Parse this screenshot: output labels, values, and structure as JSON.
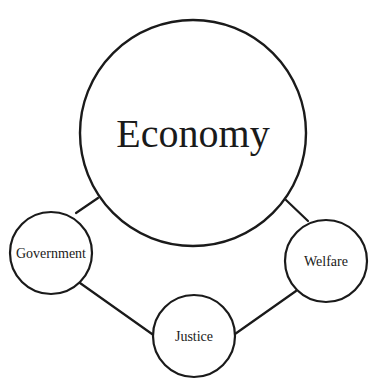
{
  "diagram": {
    "stroke_color": "#1a1a1a",
    "background": "#ffffff",
    "nodes": [
      {
        "id": "economy",
        "label": "Economy",
        "cx": 193,
        "cy": 133,
        "r": 113,
        "font_size": 40
      },
      {
        "id": "government",
        "label": "Government",
        "cx": 51,
        "cy": 253,
        "r": 41,
        "font_size": 14
      },
      {
        "id": "welfare",
        "label": "Welfare",
        "cx": 326,
        "cy": 261,
        "r": 41,
        "font_size": 14
      },
      {
        "id": "justice",
        "label": "Justice",
        "cx": 194,
        "cy": 336,
        "r": 41,
        "font_size": 14
      }
    ],
    "edges": [
      {
        "from": "economy",
        "to": "government",
        "x1": 98,
        "y1": 198,
        "x2": 76,
        "y2": 213
      },
      {
        "from": "economy",
        "to": "welfare",
        "x1": 286,
        "y1": 200,
        "x2": 308,
        "y2": 221
      },
      {
        "from": "government",
        "to": "justice",
        "x1": 80,
        "y1": 283,
        "x2": 152,
        "y2": 334
      },
      {
        "from": "justice",
        "to": "welfare",
        "x1": 235,
        "y1": 334,
        "x2": 296,
        "y2": 291
      }
    ]
  }
}
